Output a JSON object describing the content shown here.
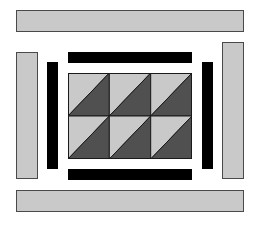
{
  "diagram": {
    "title": "",
    "colors": {
      "light": "#c9c9c9",
      "dark": "#505050",
      "black": "#000000",
      "outline": "#4a4a4a",
      "background": "#ffffff"
    },
    "outer_strips": [
      {
        "id": "top",
        "x": 16,
        "y": 10,
        "w": 228,
        "h": 22
      },
      {
        "id": "left",
        "x": 16,
        "y": 52,
        "w": 22,
        "h": 127
      },
      {
        "id": "right",
        "x": 222,
        "y": 42,
        "w": 22,
        "h": 137
      },
      {
        "id": "bottom",
        "x": 16,
        "y": 190,
        "w": 228,
        "h": 22
      }
    ],
    "inner_strips": [
      {
        "id": "top",
        "x": 68,
        "y": 52,
        "w": 124,
        "h": 11
      },
      {
        "id": "left",
        "x": 47,
        "y": 62,
        "w": 11,
        "h": 107
      },
      {
        "id": "right",
        "x": 202,
        "y": 62,
        "w": 11,
        "h": 107
      },
      {
        "id": "bottom",
        "x": 68,
        "y": 169,
        "w": 124,
        "h": 11
      }
    ],
    "center": {
      "x": 68,
      "y": 73,
      "w": 124,
      "h": 86,
      "rows": 2,
      "cols": 3,
      "unit": "half-square triangle"
    }
  }
}
